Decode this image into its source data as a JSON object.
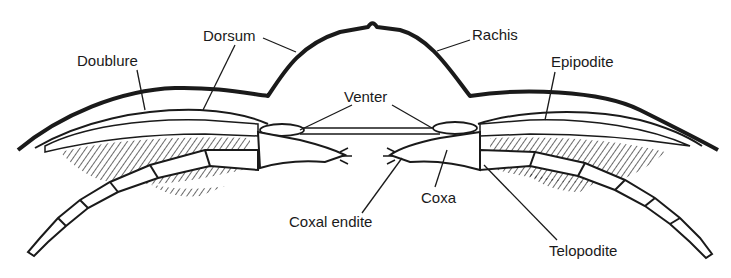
{
  "diagram": {
    "labels": {
      "dorsum": "Dorsum",
      "doublure": "Doublure",
      "rachis": "Rachis",
      "epipodite": "Epipodite",
      "venter": "Venter",
      "coxa": "Coxa",
      "coxal_endite": "Coxal endite",
      "telopodite": "Telopodite"
    },
    "colors": {
      "ink": "#1a1a1a",
      "background": "#ffffff"
    }
  }
}
